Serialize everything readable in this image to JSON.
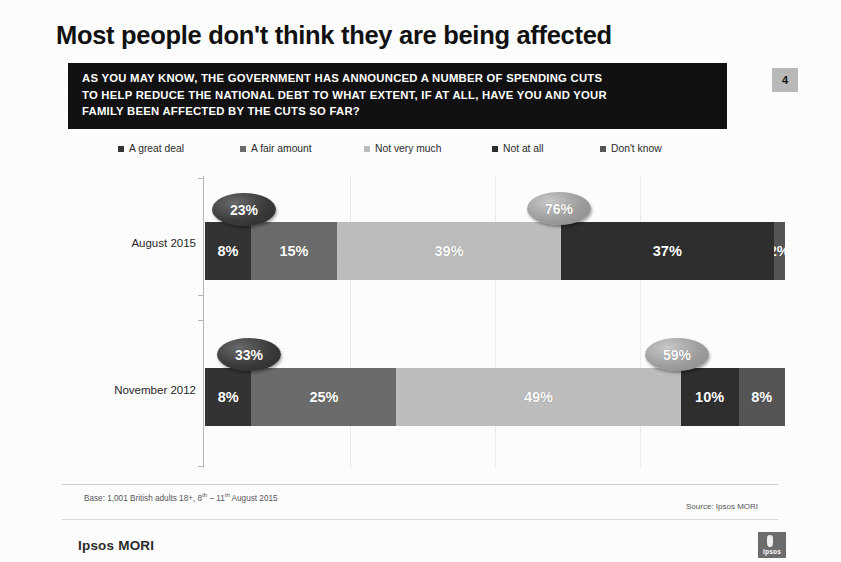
{
  "slide": {
    "title": "Most people don't think they are being affected",
    "page_number": "4",
    "question_lines": [
      "AS YOU MAY KNOW, THE GOVERNMENT HAS ANNOUNCED A NUMBER OF SPENDING CUTS",
      "TO HELP REDUCE THE NATIONAL DEBT TO WHAT EXTENT, IF AT ALL, HAVE YOU AND YOUR",
      "FAMILY BEEN AFFECTED BY THE CUTS SO FAR?"
    ]
  },
  "footer": {
    "base_note_prefix": "Base: 1,001 British adults 18+, 8",
    "base_note_sup1": "th",
    "base_note_mid": " – 11",
    "base_note_sup2": "th",
    "base_note_suffix": " August 2015",
    "base_note_plain": "Base: 1,001 British adults 18+, 8th – 11th August 2015",
    "source": "Source: Ipsos MORI",
    "brand": "Ipsos MORI",
    "logo_word": "Ipsos"
  },
  "chart_data": {
    "type": "bar",
    "orientation": "horizontal",
    "stacked": true,
    "stack_mode": "percent",
    "title": "Most people don't think they are being affected",
    "xlabel": "",
    "ylabel": "",
    "xlim": [
      0,
      100
    ],
    "grid": false,
    "legend_position": "top",
    "value_suffix": "%",
    "categories": [
      "August 2015",
      "November 2012"
    ],
    "legend": [
      {
        "label": "A great deal",
        "color": "#333333"
      },
      {
        "label": "A fair amount",
        "color": "#6b6b6b"
      },
      {
        "label": "Not very much",
        "color": "#bdbdbd"
      },
      {
        "label": "Not at all",
        "color": "#2e2e2e"
      },
      {
        "label": "Don't know",
        "color": "#555555"
      }
    ],
    "series": [
      {
        "name": "A great deal",
        "color": "#333333",
        "values": [
          8,
          8
        ]
      },
      {
        "name": "A fair amount",
        "color": "#6b6b6b",
        "values": [
          15,
          25
        ]
      },
      {
        "name": "Not very much",
        "color": "#bdbdbd",
        "values": [
          39,
          49
        ]
      },
      {
        "name": "Not at all",
        "color": "#2e2e2e",
        "values": [
          37,
          10
        ]
      },
      {
        "name": "Don't know",
        "color": "#555555",
        "values": [
          2,
          8
        ]
      }
    ],
    "rows": [
      {
        "category": "August 2015",
        "segments": [
          {
            "series": "A great deal",
            "value": 8,
            "label": "8%",
            "color": "#333333"
          },
          {
            "series": "A fair amount",
            "value": 15,
            "label": "15%",
            "color": "#6b6b6b"
          },
          {
            "series": "Not very much",
            "value": 39,
            "label": "39%",
            "color": "#bdbdbd"
          },
          {
            "series": "Not at all",
            "value": 37,
            "label": "37%",
            "color": "#2e2e2e"
          },
          {
            "series": "Don't know",
            "value": 2,
            "label": "2%",
            "color": "#555555"
          }
        ],
        "callouts": [
          {
            "label": "23%",
            "value": 23,
            "style": "dark",
            "meaning": "A great deal + A fair amount",
            "left": 212,
            "top": 193
          },
          {
            "label": "76%",
            "value": 76,
            "style": "light",
            "meaning": "Not very much + Not at all",
            "left": 527,
            "top": 192
          }
        ]
      },
      {
        "category": "November 2012",
        "segments": [
          {
            "series": "A great deal",
            "value": 8,
            "label": "8%",
            "color": "#333333"
          },
          {
            "series": "A fair amount",
            "value": 25,
            "label": "25%",
            "color": "#6b6b6b"
          },
          {
            "series": "Not very much",
            "value": 49,
            "label": "49%",
            "color": "#bdbdbd"
          },
          {
            "series": "Not at all",
            "value": 10,
            "label": "10%",
            "color": "#2e2e2e"
          },
          {
            "series": "Don't know",
            "value": 8,
            "label": "8%",
            "color": "#555555"
          }
        ],
        "callouts": [
          {
            "label": "33%",
            "value": 33,
            "style": "dark",
            "meaning": "A great deal + A fair amount",
            "left": 217,
            "top": 338
          },
          {
            "label": "59%",
            "value": 59,
            "style": "light",
            "meaning": "Not very much + Not at all",
            "left": 645,
            "top": 338
          }
        ]
      }
    ]
  }
}
